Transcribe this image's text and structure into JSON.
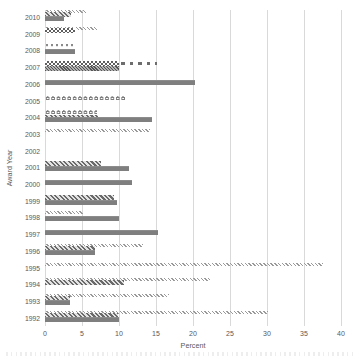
{
  "chart_data": {
    "type": "bar",
    "orientation": "horizontal",
    "title": "",
    "xlabel": "Percent",
    "ylabel": "Award Year",
    "xlim": [
      0,
      40
    ],
    "xticks": [
      0,
      5,
      10,
      15,
      20,
      25,
      30,
      35,
      40
    ],
    "grid": "vertical-light-gray",
    "legend": "none",
    "bar_color_main": "#7f7f7f",
    "text_color": "#595959",
    "years": [
      {
        "label": "2010",
        "bars": [
          {
            "pattern": "zigzag-light",
            "value": 5.6,
            "row": 0
          },
          {
            "pattern": "zigzag-dark",
            "value": 3.5,
            "row": 0.4
          },
          {
            "pattern": "solid",
            "value": 2.6,
            "row": 1.2
          }
        ]
      },
      {
        "label": "2009",
        "bars": [
          {
            "pattern": "zigzag-light",
            "value": 7.0,
            "row": 0
          },
          {
            "pattern": "checker",
            "value": 4.0,
            "row": 0.3
          }
        ]
      },
      {
        "label": "2008",
        "bars": [
          {
            "pattern": "wave",
            "value": 4.1,
            "row": 0.2
          },
          {
            "pattern": "solid",
            "value": 4.0,
            "row": 1.1
          }
        ]
      },
      {
        "label": "2007",
        "bars": [
          {
            "pattern": "dash",
            "value": 15.2,
            "row": 0.35
          },
          {
            "pattern": "checker",
            "value": 10.0,
            "row": 0.2
          },
          {
            "pattern": "hatch",
            "value": 10.0,
            "row": 1.1
          }
        ]
      },
      {
        "label": "2006",
        "bars": [
          {
            "pattern": "solid",
            "value": 20.3,
            "row": 0.6
          }
        ]
      },
      {
        "label": "2005",
        "bars": [
          {
            "pattern": "chain",
            "value": 10.8,
            "row": 0.4
          }
        ]
      },
      {
        "label": "2004",
        "bars": [
          {
            "pattern": "chain",
            "value": 7.0,
            "row": 0
          },
          {
            "pattern": "zigzag-dark",
            "value": 7.1,
            "row": 0.9
          },
          {
            "pattern": "solid",
            "value": 14.4,
            "row": 1.4
          }
        ]
      },
      {
        "label": "2003",
        "bars": [
          {
            "pattern": "zigzag-light",
            "value": 14.2,
            "row": 0.5
          }
        ]
      },
      {
        "label": "2002",
        "bars": []
      },
      {
        "label": "2001",
        "bars": [
          {
            "pattern": "zigzag-dark",
            "value": 7.5,
            "row": 0.2
          },
          {
            "pattern": "solid",
            "value": 11.4,
            "row": 1.2
          }
        ]
      },
      {
        "label": "2000",
        "bars": [
          {
            "pattern": "solid",
            "value": 11.7,
            "row": 0.6
          }
        ]
      },
      {
        "label": "1999",
        "bars": [
          {
            "pattern": "zigzag-dark",
            "value": 9.3,
            "row": 0.3
          },
          {
            "pattern": "solid",
            "value": 9.7,
            "row": 1.2
          }
        ]
      },
      {
        "label": "1998",
        "bars": [
          {
            "pattern": "zigzag-light",
            "value": 5.2,
            "row": 0.1
          },
          {
            "pattern": "solid",
            "value": 10.0,
            "row": 1.1
          }
        ]
      },
      {
        "label": "1997",
        "bars": [
          {
            "pattern": "solid",
            "value": 15.3,
            "row": 0.6
          }
        ]
      },
      {
        "label": "1996",
        "bars": [
          {
            "pattern": "zigzag-light",
            "value": 13.3,
            "row": 0
          },
          {
            "pattern": "zigzag-dark",
            "value": 6.7,
            "row": 0.4
          },
          {
            "pattern": "solid",
            "value": 6.7,
            "row": 1.3
          }
        ]
      },
      {
        "label": "1995",
        "bars": [
          {
            "pattern": "zigzag-light",
            "value": 37.5,
            "row": 0.5
          }
        ]
      },
      {
        "label": "1994",
        "bars": [
          {
            "pattern": "zigzag-light",
            "value": 22.3,
            "row": 0.1
          },
          {
            "pattern": "zigzag-dark",
            "value": 10.7,
            "row": 0.6
          }
        ]
      },
      {
        "label": "1993",
        "bars": [
          {
            "pattern": "zigzag-light",
            "value": 16.7,
            "row": 0
          },
          {
            "pattern": "zigzag-dark",
            "value": 3.4,
            "row": 0.5
          },
          {
            "pattern": "solid",
            "value": 3.4,
            "row": 1.3
          }
        ]
      },
      {
        "label": "1992",
        "bars": [
          {
            "pattern": "zigzag-light",
            "value": 30.2,
            "row": 0
          },
          {
            "pattern": "zigzag-dark",
            "value": 9.8,
            "row": 0.5
          },
          {
            "pattern": "solid",
            "value": 10.0,
            "row": 1.3
          }
        ]
      }
    ]
  }
}
